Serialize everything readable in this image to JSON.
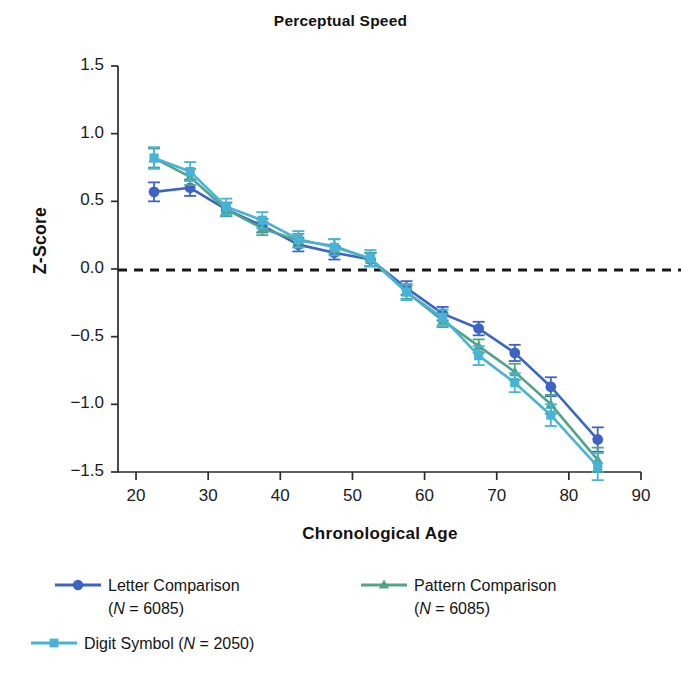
{
  "chart_data": {
    "type": "line",
    "title": "Perceptual Speed",
    "xlabel": "Chronological Age",
    "ylabel": "Z-Score",
    "xlim": [
      17.5,
      90
    ],
    "ylim": [
      -1.5,
      1.5
    ],
    "xticks": [
      20,
      30,
      40,
      50,
      60,
      70,
      80,
      90
    ],
    "yticks": [
      1.5,
      1.0,
      0.5,
      0.0,
      -0.5,
      -1.0,
      -1.5
    ],
    "ytick_labels": [
      "1.5",
      "1.0",
      "0.5",
      "0.0",
      "-0.5",
      "-1.0",
      "-1.5"
    ],
    "xtick_labels": [
      "20",
      "30",
      "40",
      "50",
      "60",
      "70",
      "80",
      "90"
    ],
    "grid": false,
    "legend_position": "below",
    "reference_line": {
      "y": 0.0,
      "style": "dashed",
      "color": "#1a1a1a"
    },
    "error_bars": "standard error (vertical caps on every point)",
    "x": [
      22.5,
      27.5,
      32.5,
      37.5,
      42.5,
      47.5,
      52.5,
      57.5,
      62.5,
      67.5,
      72.5,
      77.5,
      84
    ],
    "series": [
      {
        "name": "Letter Comparison",
        "n_label": "(N = 6085)",
        "color": "#3d63c4",
        "marker": "circle",
        "values": [
          0.57,
          0.6,
          0.44,
          0.32,
          0.18,
          0.12,
          0.07,
          -0.14,
          -0.33,
          -0.44,
          -0.62,
          -0.87,
          -1.26
        ],
        "errors": [
          0.07,
          0.06,
          0.05,
          0.05,
          0.05,
          0.05,
          0.05,
          0.05,
          0.05,
          0.05,
          0.06,
          0.07,
          0.09
        ]
      },
      {
        "name": "Pattern Comparison",
        "n_label": "(N = 6085)",
        "color": "#51a389",
        "marker": "triangle",
        "values": [
          0.82,
          0.68,
          0.44,
          0.3,
          0.21,
          0.17,
          0.07,
          -0.17,
          -0.38,
          -0.57,
          -0.76,
          -1.0,
          -1.41
        ],
        "errors": [
          0.07,
          0.06,
          0.05,
          0.05,
          0.05,
          0.05,
          0.05,
          0.05,
          0.05,
          0.05,
          0.06,
          0.07,
          0.09
        ]
      },
      {
        "name": "Digit Symbol",
        "n_label": "(N = 2050)",
        "color": "#48b3d5",
        "marker": "square",
        "values": [
          0.82,
          0.72,
          0.46,
          0.36,
          0.22,
          0.16,
          0.08,
          -0.17,
          -0.36,
          -0.64,
          -0.84,
          -1.08,
          -1.46
        ],
        "errors": [
          0.08,
          0.07,
          0.06,
          0.06,
          0.06,
          0.06,
          0.06,
          0.06,
          0.06,
          0.07,
          0.07,
          0.08,
          0.1
        ]
      }
    ]
  },
  "chart": {
    "title": "Perceptual Speed",
    "ylabel": "Z-Score",
    "xlabel": "Chronological Age"
  },
  "legend": {
    "letter": {
      "label": "Letter Comparison",
      "n": "(N = 6085)"
    },
    "pattern": {
      "label": "Pattern Comparison",
      "n": "(N = 6085)"
    },
    "digit": {
      "label": "Digit Symbol",
      "n": "(N = 2050)"
    }
  }
}
